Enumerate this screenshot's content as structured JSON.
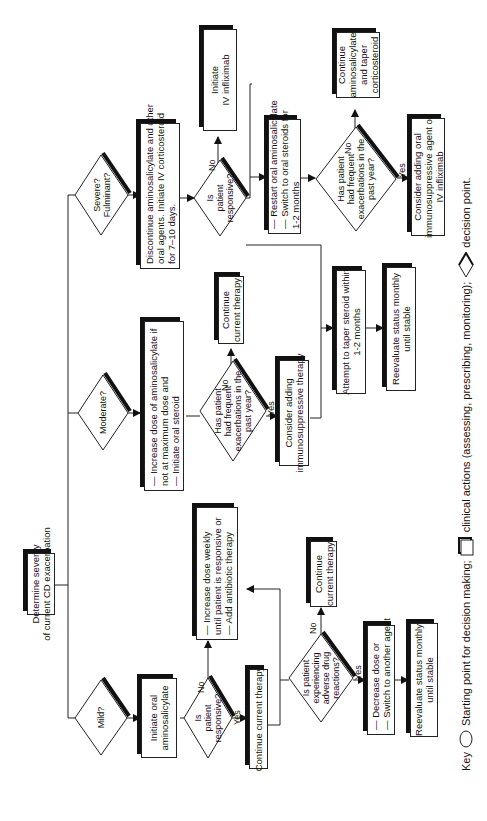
{
  "start": {
    "lines": [
      "Determine severity",
      "of current CD exacerbation"
    ]
  },
  "mild": {
    "decision": "Mild?",
    "action1": {
      "lines": [
        "Initiate oral",
        "aminosalicylate"
      ]
    },
    "q1": {
      "lines": [
        "Is",
        "patient",
        "responsive?"
      ],
      "yes": "Yes",
      "no": "No"
    },
    "no_action": {
      "lines": [
        "— Increase dose weekly",
        "   until patient is responsive or",
        "— Add antibiotic therapy"
      ]
    },
    "yes_action": {
      "lines": [
        "Continue current therapy"
      ]
    },
    "q2": {
      "lines": [
        "Is patient",
        "experiencing",
        "adverse drug",
        "reactions?"
      ],
      "yes": "Yes",
      "no": "No"
    },
    "q2_no_action": {
      "lines": [
        "Continue",
        "current therapy"
      ]
    },
    "q2_yes_action": {
      "lines": [
        "— Decrease dose or",
        "— Switch to another agent"
      ]
    },
    "final": {
      "lines": [
        "Reevaluate status monthly",
        "until stable"
      ]
    }
  },
  "moderate": {
    "decision": "Moderate?",
    "action1": {
      "lines": [
        "— Increase dose of aminosalicylate if",
        "   not at maximum dose and",
        "— Initiate oral steroid"
      ]
    },
    "q1": {
      "lines": [
        "Has patient",
        "had frequent",
        "exacerbations in the",
        "past year?"
      ],
      "yes": "Yes",
      "no": "No"
    },
    "no_action": {
      "lines": [
        "Continue",
        "current therapy"
      ]
    },
    "yes_action": {
      "lines": [
        "Consider adding",
        "immunosuppressive therapy"
      ]
    },
    "taper": {
      "lines": [
        "Attempt to taper steroid within",
        "1-2 months"
      ]
    },
    "final": {
      "lines": [
        "Reevaluate status monthly",
        "until stable"
      ]
    }
  },
  "severe": {
    "decision": [
      "Severe?",
      "Fulminant?"
    ],
    "action1": {
      "lines": [
        "Discontinue aminosalicylate and other",
        "oral agents. Initiate IV corticosteroid",
        "for 7–10 days."
      ]
    },
    "q1": {
      "lines": [
        "Is",
        "patient",
        "responsive?"
      ],
      "no": "No"
    },
    "no_action": {
      "lines": [
        "Initiate",
        "IV infliximab"
      ]
    },
    "restart": {
      "lines": [
        "— Restart oral aminosalicylate",
        "— Switch to oral steroids for",
        "   1-2 months"
      ]
    },
    "q2": {
      "lines": [
        "Has patient",
        "had frequent",
        "exacerbations in the",
        "past year?"
      ],
      "yes": "Yes",
      "no": "No"
    },
    "q2_no_action": {
      "lines": [
        "Continue",
        "aminosalicylate",
        "and taper",
        "corticosteroid"
      ]
    },
    "q2_yes_action": {
      "lines": [
        "Consider adding oral",
        "immunosuppressive agent or",
        "IV infliximab"
      ]
    }
  },
  "key": {
    "label": "Key",
    "oval_text": "Starting point for decision making;",
    "rect_text": "clinical actions (assessing, prescribing, monitoring);",
    "diamond_text": "decision point."
  }
}
